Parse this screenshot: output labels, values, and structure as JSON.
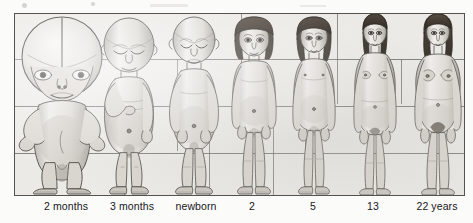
{
  "figure": {
    "caption_row_label": "age stages",
    "medium": "pencil-illustration-scan",
    "background_color": "#eceae6",
    "ink_color": "#55534f",
    "label_color": "#17161a",
    "grid": {
      "horizontal_lines": 3,
      "horizontal_y": [
        45,
        92,
        139
      ],
      "vertical_segments": [
        {
          "x": 109,
          "y1": 92,
          "y2": 183
        },
        {
          "x": 162,
          "y1": 45,
          "y2": 139
        },
        {
          "x": 194,
          "y1": 92,
          "y2": 183
        },
        {
          "x": 226,
          "y1": 0,
          "y2": 92
        },
        {
          "x": 258,
          "y1": 92,
          "y2": 183
        },
        {
          "x": 290,
          "y1": 45,
          "y2": 139
        },
        {
          "x": 322,
          "y1": 0,
          "y2": 92
        },
        {
          "x": 354,
          "y1": 139,
          "y2": 183
        },
        {
          "x": 386,
          "y1": 45,
          "y2": 92
        },
        {
          "x": 418,
          "y1": 92,
          "y2": 183
        }
      ]
    },
    "stages": [
      {
        "id": "stage-2-months",
        "label": "2 months",
        "label_x": 52,
        "center_x": 52,
        "body_height_px": 178,
        "head_fraction": 0.5,
        "description": "fetus, two months; head about half of total body length"
      },
      {
        "id": "stage-3-months",
        "label": "3 months",
        "label_x": 118,
        "center_x": 118,
        "body_height_px": 176,
        "head_fraction": 0.35,
        "description": "fetus, three months"
      },
      {
        "id": "stage-newborn",
        "label": "newborn",
        "label_x": 182,
        "center_x": 182,
        "body_height_px": 176,
        "head_fraction": 0.27,
        "description": "newborn infant"
      },
      {
        "id": "stage-2-years",
        "label": "2",
        "label_x": 252,
        "center_x": 252,
        "body_height_px": 176,
        "head_fraction": 0.22,
        "description": "child, two years"
      },
      {
        "id": "stage-5-years",
        "label": "5",
        "label_x": 313,
        "center_x": 313,
        "body_height_px": 176,
        "head_fraction": 0.18,
        "description": "child, five years"
      },
      {
        "id": "stage-13-years",
        "label": "13",
        "label_x": 373,
        "center_x": 373,
        "body_height_px": 176,
        "head_fraction": 0.14,
        "description": "adolescent, thirteen years"
      },
      {
        "id": "stage-22-years",
        "label": "22 years",
        "label_x": 437,
        "center_x": 437,
        "body_height_px": 176,
        "head_fraction": 0.125,
        "description": "adult, twenty-two years"
      }
    ]
  }
}
